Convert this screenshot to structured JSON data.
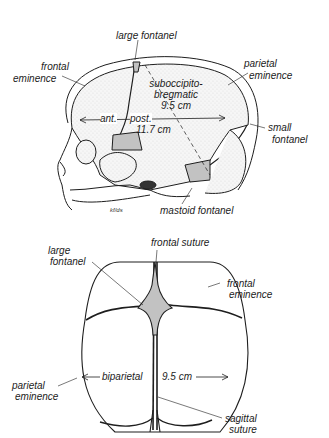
{
  "lateral_view": {
    "labels": {
      "large_fontanel": "large fontanel",
      "frontal_eminence_1": "frontal",
      "frontal_eminence_2": "eminence",
      "parietal_eminence_1": "parietal",
      "parietal_eminence_2": "eminence",
      "suboccipito_1": "suboccipito-",
      "suboccipito_2": "bregmatic",
      "suboccipito_3": "9.5 cm",
      "ant": "ant.",
      "post": "post.",
      "ant_post_value": "11.7 cm",
      "small_fontanel_1": "small",
      "small_fontanel_2": "fontanel",
      "mastoid_fontanel": "mastoid  fontanel",
      "signature": "kf/ds"
    }
  },
  "superior_view": {
    "labels": {
      "frontal_suture": "frontal  suture",
      "large_fontanel_1": "large",
      "large_fontanel_2": "fontanel",
      "frontal_eminence_1": "frontal",
      "frontal_eminence_2": "eminence",
      "parietal_eminence_1": "parietal",
      "parietal_eminence_2": "eminence",
      "biparietal": "biparietal",
      "biparietal_value": "9.5 cm",
      "sagittal_suture_1": "sagittal",
      "sagittal_suture_2": "suture"
    }
  },
  "colors": {
    "line": "#1e1e1e",
    "stipple": "#9a9a9a",
    "background": "#ffffff"
  }
}
